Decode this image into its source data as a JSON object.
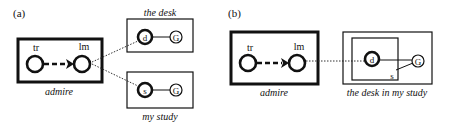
{
  "panel_a": {
    "label": "(a)",
    "verb_box": {
      "caption": "admire",
      "tr_label": "tr",
      "lm_label": "lm"
    },
    "np1": {
      "caption": "the desk",
      "head_label": "d",
      "ground_label": "G"
    },
    "np2": {
      "caption": "my study",
      "head_label": "s",
      "ground_label": "G"
    }
  },
  "panel_b": {
    "label": "(b)",
    "verb_box": {
      "caption": "admire",
      "tr_label": "tr",
      "lm_label": "lm"
    },
    "np": {
      "caption": "the desk in my study",
      "head_label": "d",
      "ground_label": "G",
      "inner_label": "s"
    }
  },
  "colors": {
    "ink": "#111111",
    "background": "#ffffff"
  }
}
